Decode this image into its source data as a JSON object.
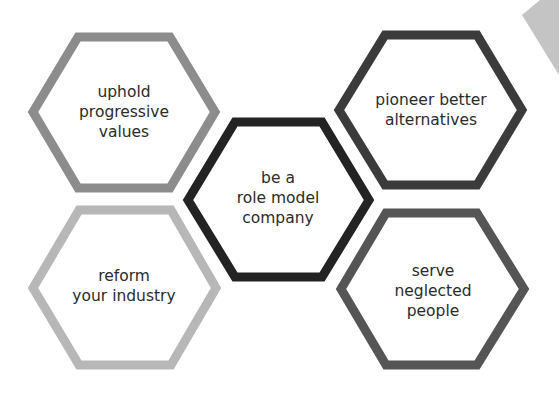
{
  "diagram": {
    "type": "hexagon cluster",
    "center": {
      "id": "center",
      "lines": [
        "be a",
        "role model",
        "company"
      ],
      "color": "#232323",
      "cx": 278,
      "cy": 200
    },
    "nodes": [
      {
        "id": "uphold",
        "lines": [
          "uphold",
          "progressive",
          "values"
        ],
        "color": "#8c8c8c",
        "cx": 124,
        "cy": 112
      },
      {
        "id": "pioneer",
        "lines": [
          "pioneer better",
          "alternatives"
        ],
        "color": "#3b3b3b",
        "cx": 431,
        "cy": 110
      },
      {
        "id": "reform",
        "lines": [
          "reform",
          "your industry"
        ],
        "color": "#b7b7b7",
        "cx": 124,
        "cy": 288
      },
      {
        "id": "serve",
        "lines": [
          "serve",
          "neglected",
          "people"
        ],
        "color": "#555555",
        "cx": 432,
        "cy": 289
      }
    ],
    "corner_shape_color": "#c4c4c4"
  }
}
